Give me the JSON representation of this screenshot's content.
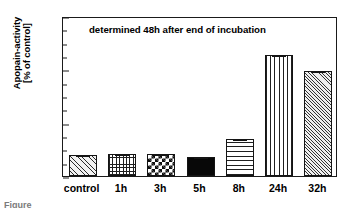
{
  "chart_data": {
    "type": "bar",
    "title": "",
    "annotation": "determined 48h after end of incubation",
    "xlabel": "",
    "ylabel_line1": "Apopain-activity",
    "ylabel_line2": "[% of control]",
    "categories": [
      "control",
      "1h",
      "3h",
      "5h",
      "8h",
      "24h",
      "32h"
    ],
    "values": [
      100,
      102,
      102,
      90,
      175,
      565,
      490
    ],
    "errors": [
      4,
      4,
      4,
      3,
      5,
      8,
      5
    ],
    "ylim": [
      0,
      750
    ],
    "yticks": [
      0,
      250,
      500,
      750
    ],
    "ytick_labels": [
      "0",
      "250",
      "500",
      "750"
    ],
    "yminor_ticks": [
      62.5,
      125,
      187.5,
      312.5,
      375,
      437.5,
      562.5,
      625,
      687.5
    ],
    "grid": false,
    "legend": false,
    "bar_patterns": [
      "diagonal-hatch-fine",
      "grid-crosshatch",
      "checkerboard",
      "solid-black",
      "horizontal-lines",
      "vertical-lines",
      "diagonal-hatch-wide"
    ],
    "series_name": "Apopain-activity"
  },
  "caption_stub": "Figure"
}
